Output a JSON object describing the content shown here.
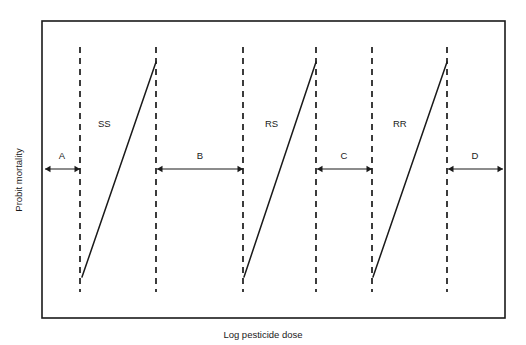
{
  "figure": {
    "frame": {
      "x": 42,
      "y": 21,
      "width": 463,
      "height": 297,
      "stroke": "#1a1a1a"
    },
    "background": "#ffffff"
  },
  "axes": {
    "ylabel": "Probit mortality",
    "xlabel": "Log pesticide dose",
    "ylabel_x": 22,
    "ylabel_y": 180,
    "xlabel_x": 263,
    "xlabel_y": 338
  },
  "chart_data": {
    "type": "line",
    "title": "",
    "xlabel": "Log pesticide dose",
    "ylabel": "Probit mortality",
    "grid": false,
    "legend": "none",
    "axis_ticks": false,
    "series": [
      {
        "name": "SS",
        "label": "SS",
        "label_x": 98,
        "label_y": 127,
        "x_start": 82,
        "y_start": 277,
        "x_end": 156,
        "y_end": 62,
        "color": "#1a1a1a"
      },
      {
        "name": "RS",
        "label": "RS",
        "label_x": 265,
        "label_y": 127,
        "x_start": 244,
        "y_start": 277,
        "x_end": 316,
        "y_end": 62,
        "color": "#1a1a1a"
      },
      {
        "name": "RR",
        "label": "RR",
        "label_x": 393,
        "label_y": 127,
        "x_start": 373,
        "y_start": 277,
        "x_end": 447,
        "y_end": 62,
        "color": "#1a1a1a"
      }
    ],
    "dashed_lines": [
      {
        "id": "d1",
        "x": 80,
        "y_top": 47,
        "y_bottom": 292
      },
      {
        "id": "d2",
        "x": 156,
        "y_top": 47,
        "y_bottom": 292
      },
      {
        "id": "d3",
        "x": 243,
        "y_top": 47,
        "y_bottom": 292
      },
      {
        "id": "d4",
        "x": 316,
        "y_top": 47,
        "y_bottom": 292
      },
      {
        "id": "d5",
        "x": 372,
        "y_top": 47,
        "y_bottom": 292
      },
      {
        "id": "d6",
        "x": 447,
        "y_top": 47,
        "y_bottom": 292
      }
    ],
    "gap_markers": [
      {
        "label": "A",
        "x_start": 45,
        "x_end": 80,
        "y": 169,
        "label_x": 62,
        "label_y": 159
      },
      {
        "label": "B",
        "x_start": 157,
        "x_end": 243,
        "y": 169,
        "label_x": 200,
        "label_y": 159
      },
      {
        "label": "C",
        "x_start": 317,
        "x_end": 372,
        "y": 169,
        "label_x": 344,
        "label_y": 159
      },
      {
        "label": "D",
        "x_start": 448,
        "x_end": 503,
        "y": 169,
        "label_x": 475,
        "label_y": 159
      }
    ]
  }
}
